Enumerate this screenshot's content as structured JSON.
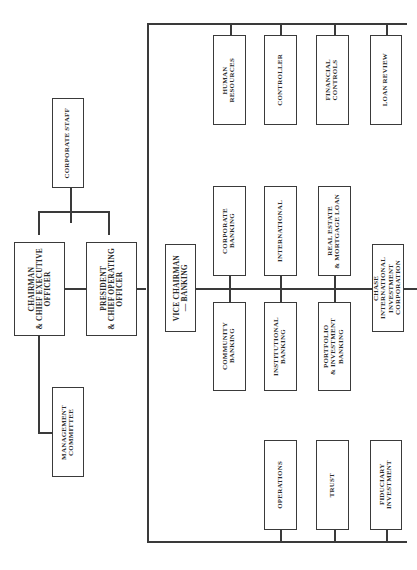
{
  "diagram": {
    "type": "organization-chart",
    "orientation": "rotated-90",
    "nodes": {
      "corporate_staff": "CORPORATE STAFF",
      "chairman": "CHAIRMAN\n& CHIEF EXECUTIVE\nOFFICER",
      "president": "PRESIDENT\n& CHIEF OPERATING\nOFFICER",
      "management_committee": "MANAGEMENT\nCOMMITTEE",
      "vice_chairman": "VICE CHAIRMAN\n— BANKING",
      "corporate_banking": "CORPORATE\nBANKING",
      "community_banking": "COMMUNITY\nBANKING",
      "international": "INTERNATIONAL",
      "institutional_banking": "INSTITUTIONAL\nBANKING",
      "real_estate": "REAL ESTATE\n& MORTGAGE LOAN",
      "portfolio_investment": "PORTFOLIO\n& INVESTMENT\nBANKING",
      "chase_international": "CHASE\nINTERNATIONAL\nINVESTMENT\nCORPORATION",
      "human_resources": "HUMAN\nRESOURCES",
      "controller": "CONTROLLER",
      "financial_controls": "FINANCIAL\nCONTROLS",
      "loan_review": "LOAN REVIEW",
      "operations": "OPERATIONS",
      "trust": "TRUST",
      "fiduciary_investment": "FIDUCIARY\nINVESTMENT"
    }
  }
}
